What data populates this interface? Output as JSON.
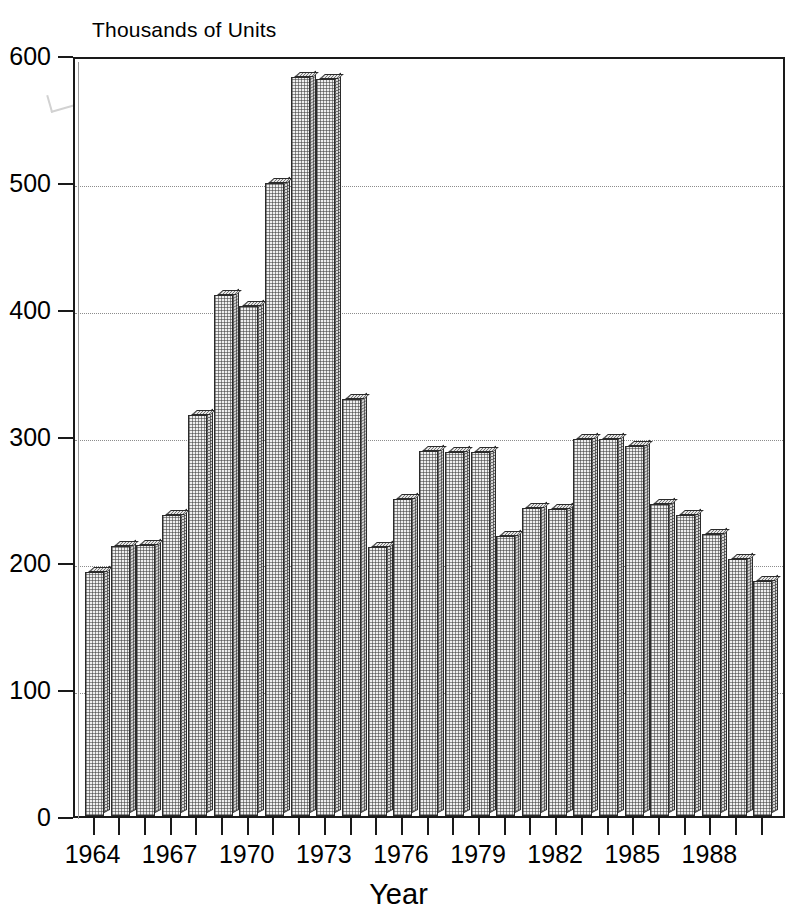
{
  "chart_data": {
    "type": "bar",
    "title": "",
    "ylabel": "Thousands of Units",
    "xlabel": "Year",
    "ylim": [
      0,
      600
    ],
    "ytick_values": [
      0,
      100,
      200,
      300,
      400,
      500,
      600
    ],
    "ytick_labels": [
      "0",
      "100",
      "200",
      "300",
      "400",
      "500",
      "600"
    ],
    "xtick_labels": [
      "1964",
      "1967",
      "1970",
      "1973",
      "1976",
      "1979",
      "1982",
      "1985",
      "1988"
    ],
    "xtick_years": [
      1964,
      1967,
      1970,
      1973,
      1976,
      1979,
      1982,
      1985,
      1988
    ],
    "grid": "horizontal-dotted",
    "legend": "none",
    "bar_style": "3d-stippled",
    "categories": [
      "1964",
      "1965",
      "1966",
      "1967",
      "1968",
      "1969",
      "1970",
      "1971",
      "1972",
      "1973",
      "1974",
      "1975",
      "1976",
      "1977",
      "1978",
      "1979",
      "1980",
      "1981",
      "1982",
      "1983",
      "1984",
      "1985",
      "1986",
      "1987",
      "1988",
      "1989",
      "1990"
    ],
    "values": [
      192,
      213,
      214,
      237,
      316,
      411,
      402,
      499,
      583,
      581,
      329,
      212,
      250,
      288,
      287,
      287,
      221,
      243,
      242,
      297,
      297,
      292,
      246,
      237,
      222,
      203,
      185
    ]
  },
  "figure": {
    "y_caption": "Thousands of Units",
    "x_title": "Year"
  }
}
